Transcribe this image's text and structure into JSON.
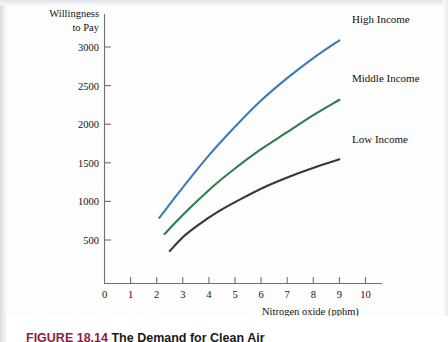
{
  "figure": {
    "number_label": "FIGURE 18.14",
    "title": "The Demand for Clean Air"
  },
  "chart_data": {
    "type": "line",
    "title": "",
    "xlabel": "Nitrogen oxide (pphm)",
    "ylabel": "Willingness to Pay",
    "ylabel_line1": "Willingness",
    "ylabel_line2": "to Pay",
    "xlim": [
      0,
      11.3
    ],
    "ylim": [
      0,
      3300
    ],
    "grid": false,
    "legend_position": "right-inline-labels",
    "xticks": [
      0,
      1,
      2,
      3,
      4,
      5,
      6,
      7,
      8,
      9,
      10
    ],
    "xtick_labels": [
      "0",
      "1",
      "2",
      "3",
      "4",
      "5",
      "6",
      "7",
      "8",
      "9",
      "10"
    ],
    "yticks": [
      500,
      1000,
      1500,
      2000,
      2500,
      3000
    ],
    "ytick_labels": [
      "500",
      "1000",
      "1500",
      "2000",
      "2500",
      "3000"
    ],
    "series": [
      {
        "name": "High Income",
        "color": "#3a7cb8",
        "x": [
          2.1,
          2.6,
          3.2,
          4.0,
          5.0,
          6.0,
          7.0,
          8.0,
          9.0
        ],
        "values": [
          850,
          1070,
          1330,
          1660,
          2030,
          2370,
          2660,
          2920,
          3150
        ]
      },
      {
        "name": "Middle Income",
        "color": "#2e7d4f",
        "x": [
          2.3,
          2.8,
          3.4,
          4.2,
          5.0,
          6.0,
          7.0,
          8.0,
          9.0
        ],
        "values": [
          640,
          820,
          1020,
          1270,
          1490,
          1740,
          1960,
          2180,
          2380
        ]
      },
      {
        "name": "Low Income",
        "color": "#3d3240",
        "x": [
          2.5,
          3.0,
          3.6,
          4.4,
          5.2,
          6.2,
          7.2,
          8.1,
          9.0
        ],
        "values": [
          420,
          600,
          760,
          940,
          1090,
          1260,
          1400,
          1510,
          1610
        ]
      }
    ]
  },
  "colors": {
    "axis": "#6f6f6f",
    "text": "#15100f",
    "caption_accent": "#8b2046",
    "caption_text": "#1a1a1a",
    "background": "#fdfdfd"
  }
}
